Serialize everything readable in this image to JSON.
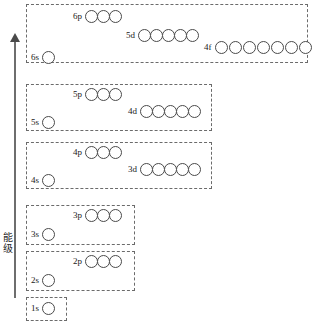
{
  "figure": {
    "axis": {
      "label": "能级",
      "direction": "up",
      "meaning": "energy-level-increasing"
    },
    "shells": [
      {
        "name": "period-6",
        "box": {
          "x": 26,
          "y": 4,
          "w": 282,
          "h": 59
        },
        "orbitals": [
          {
            "name": "6p",
            "label": "6p",
            "count": 3,
            "x": 73,
            "y": 10
          },
          {
            "name": "5d",
            "label": "5d",
            "count": 5,
            "x": 126,
            "y": 29
          },
          {
            "name": "4f",
            "label": "4f",
            "count": 7,
            "x": 204,
            "y": 41
          },
          {
            "name": "6s",
            "label": "6s",
            "count": 1,
            "x": 31,
            "y": 51
          }
        ]
      },
      {
        "name": "period-5",
        "box": {
          "x": 26,
          "y": 84,
          "w": 186,
          "h": 47
        },
        "orbitals": [
          {
            "name": "5p",
            "label": "5p",
            "count": 3,
            "x": 73,
            "y": 88
          },
          {
            "name": "4d",
            "label": "4d",
            "count": 5,
            "x": 128,
            "y": 105
          },
          {
            "name": "5s",
            "label": "5s",
            "count": 1,
            "x": 31,
            "y": 116
          }
        ]
      },
      {
        "name": "period-4",
        "box": {
          "x": 26,
          "y": 142,
          "w": 186,
          "h": 47
        },
        "orbitals": [
          {
            "name": "4p",
            "label": "4p",
            "count": 3,
            "x": 73,
            "y": 146
          },
          {
            "name": "3d",
            "label": "3d",
            "count": 5,
            "x": 128,
            "y": 163
          },
          {
            "name": "4s",
            "label": "4s",
            "count": 1,
            "x": 31,
            "y": 174
          }
        ]
      },
      {
        "name": "period-3",
        "box": {
          "x": 26,
          "y": 205,
          "w": 109,
          "h": 40
        },
        "orbitals": [
          {
            "name": "3p",
            "label": "3p",
            "count": 3,
            "x": 73,
            "y": 209
          },
          {
            "name": "3s",
            "label": "3s",
            "count": 1,
            "x": 31,
            "y": 228
          }
        ]
      },
      {
        "name": "period-2",
        "box": {
          "x": 26,
          "y": 251,
          "w": 109,
          "h": 40
        },
        "orbitals": [
          {
            "name": "2p",
            "label": "2p",
            "count": 3,
            "x": 73,
            "y": 255
          },
          {
            "name": "2s",
            "label": "2s",
            "count": 1,
            "x": 31,
            "y": 274
          }
        ]
      },
      {
        "name": "period-1",
        "box": {
          "x": 26,
          "y": 297,
          "w": 41,
          "h": 24
        },
        "orbitals": [
          {
            "name": "1s",
            "label": "1s",
            "count": 1,
            "x": 31,
            "y": 302
          }
        ]
      }
    ]
  }
}
